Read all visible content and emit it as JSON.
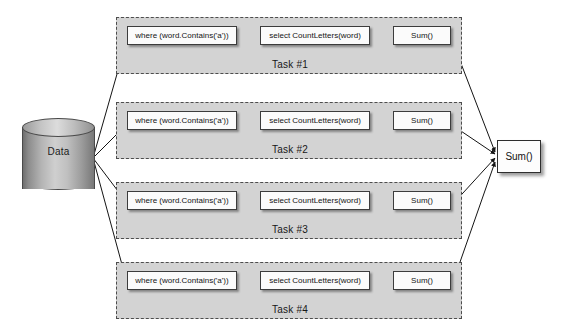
{
  "diagram": {
    "canvas": {
      "width": 571,
      "height": 332,
      "background": "#ffffff"
    },
    "colors": {
      "band_fill": "#d3d3d3",
      "band_border": "#4d4d4d",
      "box_fill": "#fbfbfb",
      "box_border": "#3c3c3c",
      "edge": "#141414",
      "text": "#141414"
    }
  },
  "datastore": {
    "label": "Data",
    "shape": "cylinder"
  },
  "tasks": [
    {
      "label": "Task #1",
      "top": 17,
      "operations": [
        {
          "name": "where-clause",
          "label": "where (word.Contains('a'))"
        },
        {
          "name": "select-clause",
          "label": "select CountLetters(word)"
        },
        {
          "name": "sum-clause",
          "label": "Sum()"
        }
      ]
    },
    {
      "label": "Task #2",
      "top": 102,
      "operations": [
        {
          "name": "where-clause",
          "label": "where (word.Contains('a'))"
        },
        {
          "name": "select-clause",
          "label": "select CountLetters(word)"
        },
        {
          "name": "sum-clause",
          "label": "Sum()"
        }
      ]
    },
    {
      "label": "Task #3",
      "top": 182,
      "operations": [
        {
          "name": "where-clause",
          "label": "where (word.Contains('a'))"
        },
        {
          "name": "select-clause",
          "label": "select CountLetters(word)"
        },
        {
          "name": "sum-clause",
          "label": "Sum()"
        }
      ]
    },
    {
      "label": "Task #4",
      "top": 262,
      "operations": [
        {
          "name": "where-clause",
          "label": "where (word.Contains('a'))"
        },
        {
          "name": "select-clause",
          "label": "select CountLetters(word)"
        },
        {
          "name": "sum-clause",
          "label": "Sum()"
        }
      ]
    }
  ],
  "aggregate": {
    "label": "Sum()"
  }
}
